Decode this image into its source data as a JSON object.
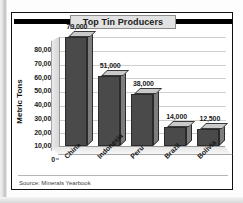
{
  "chart_data": {
    "type": "bar",
    "title": "Top Tin Producers",
    "xlabel": "",
    "ylabel": "Metric Tons",
    "categories": [
      "China",
      "Indonesia",
      "Peru",
      "Brazil",
      "Bolivia"
    ],
    "values": [
      79000,
      51000,
      38000,
      14000,
      12500
    ],
    "value_labels": [
      "79,000",
      "51,000",
      "38,000",
      "14,000",
      "12,500"
    ],
    "ylim": [
      0,
      80000
    ],
    "ytick_values": [
      0,
      10000,
      20000,
      30000,
      40000,
      50000,
      60000,
      70000,
      80000
    ],
    "ytick_labels": [
      "0",
      "10,000",
      "20,000",
      "30,000",
      "40,000",
      "50,000",
      "60,000",
      "70,000",
      "80,000"
    ],
    "grid": true,
    "grid_axis": "y",
    "legend": false,
    "legend_position": "none",
    "style": "3d-column",
    "bar_color": "#4a4a4a",
    "bar_top_color": "#c9c9c9",
    "bar_side_color": "#7d7d7d",
    "plot_background": "#ffffff",
    "gridline_color": "#cfcfcf",
    "source": "Source: Minerals Yearbook"
  },
  "frame": {
    "border_color": "#111111",
    "title_box_color": "#e2e2e2",
    "title_rule_color": "#000000"
  }
}
